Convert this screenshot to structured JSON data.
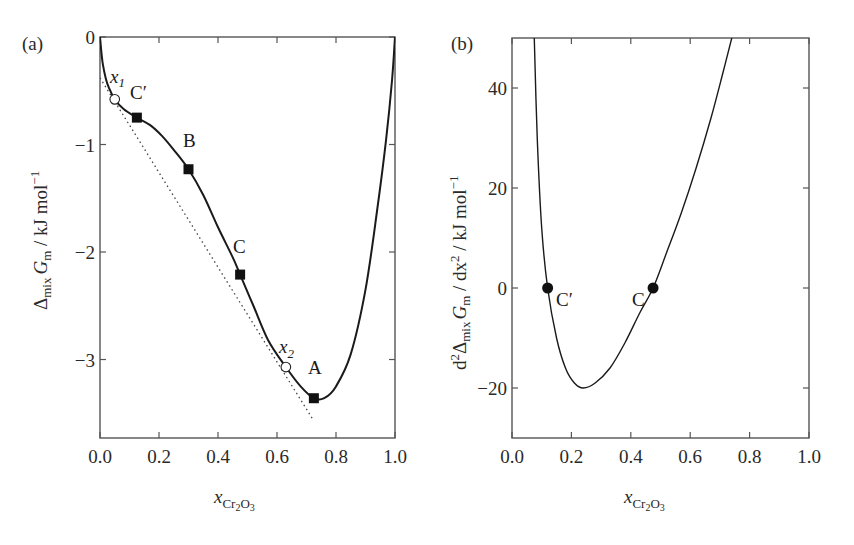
{
  "chart_data": [
    {
      "panel": "(a)",
      "type": "line",
      "title": "",
      "xlabel": "x_Cr2O3",
      "ylabel": "Δmix Gm / kJ mol⁻¹",
      "xlim": [
        0.0,
        1.0
      ],
      "ylim": [
        -3.73,
        0.0
      ],
      "grid": false,
      "x_ticks": [
        "0.0",
        "0.2",
        "0.4",
        "0.6",
        "0.8",
        "1.0"
      ],
      "y_ticks": [
        "0",
        "−1",
        "−2",
        "−3"
      ],
      "series": [
        {
          "name": "Gibbs energy of mixing",
          "style": "solid",
          "x": [
            0.0,
            0.005,
            0.01,
            0.02,
            0.03,
            0.05,
            0.08,
            0.125,
            0.17,
            0.21,
            0.25,
            0.3,
            0.35,
            0.4,
            0.45,
            0.475,
            0.52,
            0.57,
            0.63,
            0.68,
            0.725,
            0.76,
            0.8,
            0.85,
            0.9,
            0.94,
            0.97,
            0.99,
            1.0
          ],
          "y": [
            0.0,
            -0.15,
            -0.26,
            -0.39,
            -0.47,
            -0.58,
            -0.67,
            -0.75,
            -0.82,
            -0.92,
            -1.05,
            -1.23,
            -1.47,
            -1.77,
            -2.05,
            -2.21,
            -2.5,
            -2.82,
            -3.07,
            -3.25,
            -3.36,
            -3.36,
            -3.25,
            -2.95,
            -2.35,
            -1.6,
            -0.95,
            -0.4,
            0.0
          ]
        },
        {
          "name": "common tangent",
          "style": "dotted",
          "x": [
            0.0,
            0.72
          ],
          "y": [
            -0.38,
            -3.55
          ]
        }
      ],
      "points": [
        {
          "label": "x1",
          "x": 0.05,
          "y": -0.58,
          "marker": "open-circle"
        },
        {
          "label": "C′",
          "x": 0.125,
          "y": -0.75,
          "marker": "filled-square"
        },
        {
          "label": "B",
          "x": 0.3,
          "y": -1.23,
          "marker": "filled-square"
        },
        {
          "label": "C",
          "x": 0.475,
          "y": -2.21,
          "marker": "filled-square"
        },
        {
          "label": "x2",
          "x": 0.63,
          "y": -3.07,
          "marker": "open-circle"
        },
        {
          "label": "A",
          "x": 0.725,
          "y": -3.36,
          "marker": "filled-square"
        }
      ]
    },
    {
      "panel": "(b)",
      "type": "line",
      "title": "",
      "xlabel": "x_Cr2O3",
      "ylabel": "d²Δmix Gm / dx² / kJ mol⁻¹",
      "xlim": [
        0.0,
        1.0
      ],
      "ylim": [
        -30,
        50
      ],
      "grid": false,
      "x_ticks": [
        "0.0",
        "0.2",
        "0.4",
        "0.6",
        "0.8",
        "1.0"
      ],
      "y_ticks": [
        "40",
        "20",
        "0",
        "−20"
      ],
      "series": [
        {
          "name": "second derivative",
          "style": "solid",
          "x": [
            0.075,
            0.085,
            0.1,
            0.12,
            0.15,
            0.18,
            0.21,
            0.24,
            0.28,
            0.33,
            0.38,
            0.43,
            0.475,
            0.52,
            0.57,
            0.62,
            0.67,
            0.71,
            0.74
          ],
          "y": [
            50,
            30,
            12,
            0,
            -10,
            -16,
            -19,
            -20,
            -19,
            -16,
            -11,
            -5,
            0,
            7,
            15,
            24,
            34,
            43,
            50
          ]
        }
      ],
      "points": [
        {
          "label": "C′",
          "x": 0.12,
          "y": 0,
          "marker": "filled-circle"
        },
        {
          "label": "C",
          "x": 0.475,
          "y": 0,
          "marker": "filled-circle"
        }
      ]
    }
  ],
  "panel_a": {
    "label": "(a)",
    "ylabel_delta": "Δ",
    "ylabel_mix": "mix",
    "ylabel_G": "G",
    "ylabel_m": "m",
    "ylabel_unit": " / kJ mol",
    "ylabel_exp": "−1",
    "xlabel_x": "x",
    "xlabel_sub": "Cr",
    "xlabel_sub2": "2",
    "xlabel_sub3": "O",
    "xlabel_sub4": "3",
    "ann_x1": "x",
    "ann_x1_sub": "1",
    "ann_x2": "x",
    "ann_x2_sub": "2",
    "ann_Cprime": "C′",
    "ann_B": "B",
    "ann_C": "C",
    "ann_A": "A"
  },
  "panel_b": {
    "label": "(b)",
    "ylabel_d": "d",
    "ylabel_2": "2",
    "ylabel_delta": "Δ",
    "ylabel_mix": "mix",
    "ylabel_G": "G",
    "ylabel_m": "m",
    "ylabel_dx": " / dx",
    "ylabel_unit": " / kJ mol",
    "ylabel_exp": "−1",
    "xlabel_x": "x",
    "xlabel_sub": "Cr",
    "xlabel_sub2": "2",
    "xlabel_sub3": "O",
    "xlabel_sub4": "3",
    "ann_Cprime": "C′",
    "ann_C": "C"
  },
  "colors": {
    "curve": "#1a1a1a",
    "axis": "#555555",
    "tangent": "#444444",
    "background": "#ffffff"
  }
}
